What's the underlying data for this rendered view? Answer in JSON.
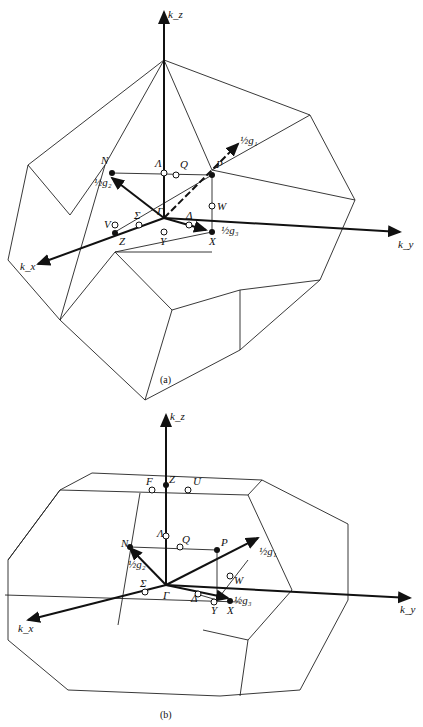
{
  "figure_a": {
    "caption": "(a)",
    "axes": {
      "kz": "k_z",
      "kx": "k_x",
      "ky": "k_y"
    },
    "points": {
      "N": "N",
      "Lambda": "Λ",
      "Q": "Q",
      "P": "P",
      "W": "W",
      "V": "V",
      "Sigma": "Σ",
      "Gamma": "Γ",
      "Delta": "Δ",
      "Z": "Z",
      "Y": "Y",
      "X": "X"
    },
    "vectors": {
      "g1": "½g₁",
      "g2": "½g₂",
      "g3": "½g₃"
    }
  },
  "figure_b": {
    "caption": "(b)",
    "axes": {
      "kz": "k_z",
      "kx": "k_x",
      "ky": "k_y"
    },
    "points": {
      "F": "F",
      "Z": "Z",
      "U": "U",
      "N": "N",
      "Lambda": "Λ",
      "Q": "Q",
      "P": "P",
      "W": "W",
      "Sigma": "Σ",
      "Gamma": "Γ",
      "Delta": "Δ",
      "Y": "Y",
      "X": "X"
    },
    "vectors": {
      "g1": "½g₁",
      "g2": "½g₂",
      "g3": "½g₃"
    }
  }
}
